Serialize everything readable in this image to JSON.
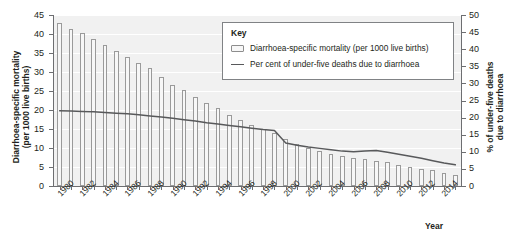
{
  "chart_data": {
    "type": "bar",
    "title": "",
    "subtitle": "",
    "xlabel": "Year",
    "ylabel": "Diarrhoea-specific mortality\n(per 1000 live births)",
    "ylabel_right": "% of under-five deaths\ndue to diarrhoea",
    "ylim": [
      0,
      45
    ],
    "ylim_right": [
      0,
      50
    ],
    "yticks": [
      0,
      5,
      10,
      15,
      20,
      25,
      30,
      35,
      40,
      45
    ],
    "yticks_right": [
      0,
      5,
      10,
      15,
      20,
      25,
      30,
      35,
      40,
      45,
      50
    ],
    "grid": true,
    "legend_position": "top-right-inside",
    "x": [
      1980,
      1981,
      1982,
      1983,
      1984,
      1985,
      1986,
      1987,
      1988,
      1989,
      1990,
      1991,
      1992,
      1993,
      1994,
      1995,
      1996,
      1997,
      1998,
      1999,
      2000,
      2001,
      2002,
      2003,
      2004,
      2005,
      2006,
      2007,
      2008,
      2009,
      2010,
      2011,
      2012,
      2013,
      2014,
      2015
    ],
    "xtick_labels": [
      "1980",
      "1982",
      "1984",
      "1986",
      "1988",
      "1990",
      "1992",
      "1994",
      "1996",
      "1998",
      "2000",
      "2002",
      "2004",
      "2006",
      "2008",
      "2010",
      "2012",
      "2014"
    ],
    "series": [
      {
        "name": "Diarrhoea-specific mortality (per 1000 live births)",
        "type": "bar",
        "axis": "left",
        "units": "per 1000 live births",
        "values": [
          42.8,
          41.3,
          40.3,
          38.8,
          37.1,
          35.6,
          34.0,
          32.4,
          31.0,
          28.6,
          26.5,
          25.2,
          23.5,
          21.8,
          20.4,
          18.6,
          17.3,
          16.1,
          15.0,
          14.0,
          12.4,
          11.0,
          10.0,
          9.3,
          8.5,
          8.0,
          7.4,
          7.0,
          6.6,
          6.2,
          5.6,
          5.1,
          4.6,
          4.1,
          3.5,
          3.0
        ]
      },
      {
        "name": "Per cent of under-five deaths due to diarrhoea",
        "type": "line",
        "axis": "right",
        "units": "%",
        "values": [
          22.0,
          21.9,
          21.8,
          21.7,
          21.5,
          21.3,
          21.1,
          20.8,
          20.5,
          20.2,
          19.8,
          19.4,
          19.0,
          18.5,
          18.1,
          17.7,
          17.3,
          16.9,
          16.5,
          16.2,
          12.6,
          11.9,
          11.4,
          11.0,
          10.6,
          10.2,
          10.0,
          10.2,
          10.4,
          9.9,
          9.3,
          8.7,
          8.1,
          7.4,
          6.7,
          6.2
        ]
      }
    ]
  },
  "legend": {
    "title": "Key",
    "entries": [
      {
        "label": "Diarrhoea-specific mortality (per 1000 live births)",
        "marker": "bar-swatch"
      },
      {
        "label": "Per cent of under-five deaths due to diarrhoea",
        "marker": "line-swatch"
      }
    ]
  },
  "axes": {
    "left_title_line1": "Diarrhoea-specific mortality",
    "left_title_line2": "(per 1000 live births)",
    "right_title_line1": "% of under-five deaths",
    "right_title_line2": "due to diarrhoea",
    "x_title": "Year"
  },
  "colors": {
    "plot_background": "#f1f1f1",
    "gridline": "#ffffff",
    "bar_fill": "#f7f7f7",
    "bar_stroke": "#9a9a9a",
    "line": "#58595b",
    "axis": "#6d6e71",
    "text": "#231f20",
    "legend_background": "#ffffff",
    "legend_border": "#808285"
  }
}
